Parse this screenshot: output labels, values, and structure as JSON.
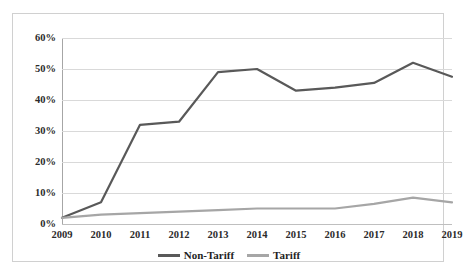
{
  "chart_data": {
    "type": "line",
    "title": "",
    "subtitle": "",
    "xlabel": "",
    "ylabel": "",
    "categories": [
      "2009",
      "2010",
      "2011",
      "2012",
      "2013",
      "2014",
      "2015",
      "2016",
      "2017",
      "2018",
      "2019"
    ],
    "series": [
      {
        "name": "Non-Tariff",
        "color": "#595959",
        "values": [
          2,
          7,
          32,
          33,
          49,
          50,
          43,
          44,
          45.5,
          52,
          47.5
        ]
      },
      {
        "name": "Tariff",
        "color": "#a6a6a6",
        "values": [
          2,
          3,
          3.5,
          4,
          4.5,
          5,
          5,
          5,
          6.5,
          8.5,
          7
        ]
      }
    ],
    "ylim": [
      0,
      60
    ],
    "ytick_values": [
      0,
      10,
      20,
      30,
      40,
      50,
      60
    ],
    "ytick_labels": [
      "0%",
      "10%",
      "20%",
      "30%",
      "40%",
      "50%",
      "60%"
    ],
    "xtick_labels": [
      "2009",
      "2010",
      "2011",
      "2012",
      "2013",
      "2014",
      "2015",
      "2016",
      "2017",
      "2018",
      "2019"
    ],
    "grid": true,
    "grid_axis": "y",
    "legend": true,
    "legend_position": "bottom",
    "legend_entries": [
      "Non-Tariff",
      "Tariff"
    ],
    "value_unit": "percent"
  },
  "legend": {
    "items": [
      {
        "label": "Non-Tariff",
        "color": "#595959"
      },
      {
        "label": "Tariff",
        "color": "#a6a6a6"
      }
    ]
  },
  "colors": {
    "non_tariff_line": "#595959",
    "tariff_line": "#a6a6a6",
    "gridline": "#d9d9d9",
    "axis": "#a6a6a6",
    "frame_border": "#d0d0d0",
    "tick_text": "#2b2b2b",
    "background": "#ffffff"
  }
}
